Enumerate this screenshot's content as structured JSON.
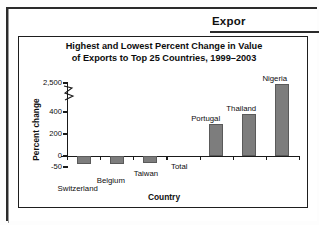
{
  "document": {
    "header_title": "Expor"
  },
  "figure": {
    "title_line1": "Highest and Lowest Percent Change in Value",
    "title_line2": "of Exports to Top 25 Countries, 1999–2003"
  },
  "chart_data": {
    "type": "bar",
    "title": "Highest and Lowest Percent Change in Value of Exports to Top 25 Countries, 1999–2003",
    "xlabel": "Country",
    "ylabel": "Percent change",
    "categories": [
      "Switzerland",
      "Belgium",
      "Taiwan",
      "Total",
      "Portugal",
      "Thailand",
      "Nigeria"
    ],
    "values": [
      -38,
      -35,
      -30,
      2,
      290,
      380,
      2400
    ],
    "tick_labels": [
      "2,500",
      "400",
      "200",
      "0",
      "-50"
    ],
    "tick_values": [
      2500,
      400,
      200,
      0,
      -50
    ],
    "ylim": [
      -50,
      2500
    ],
    "axis_break": true,
    "axis_break_between": [
      400,
      2500
    ],
    "grid": false,
    "legend": "none",
    "bar_color": "#7d7d7d",
    "annotations": [
      {
        "label": "Switzerland",
        "category": "Switzerland"
      },
      {
        "label": "Belgium",
        "category": "Belgium"
      },
      {
        "label": "Taiwan",
        "category": "Taiwan"
      },
      {
        "label": "Total",
        "category": "Total"
      },
      {
        "label": "Portugal",
        "category": "Portugal"
      },
      {
        "label": "Thailand",
        "category": "Thailand"
      },
      {
        "label": "Nigeria",
        "category": "Nigeria"
      }
    ]
  }
}
